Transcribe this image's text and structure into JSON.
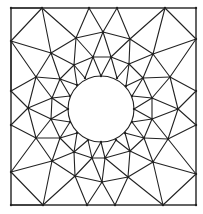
{
  "diagram": {
    "type": "triangular-finite-element-mesh",
    "colors": {
      "line": "#222222",
      "background": "#ffffff"
    },
    "border": {
      "x": 11,
      "y": 8,
      "width": 185,
      "height": 197
    },
    "hole": {
      "cx": 101,
      "cy": 109,
      "r": 33
    },
    "nodes": {
      "T1": [
        42,
        8
      ],
      "T2": [
        89,
        8
      ],
      "T3": [
        117,
        8
      ],
      "T4": [
        165,
        8
      ],
      "L1": [
        11,
        41
      ],
      "L2": [
        11,
        91
      ],
      "L3": [
        11,
        125
      ],
      "L4": [
        11,
        172
      ],
      "R1": [
        196,
        39
      ],
      "R2": [
        196,
        91
      ],
      "R3": [
        196,
        125
      ],
      "R4": [
        196,
        174
      ],
      "B1": [
        43,
        205
      ],
      "B2": [
        87,
        205
      ],
      "B3": [
        115,
        205
      ],
      "B4": [
        163,
        205
      ],
      "C1": [
        11,
        8
      ],
      "C2": [
        196,
        8
      ],
      "C3": [
        11,
        205
      ],
      "C4": [
        196,
        205
      ],
      "O1": [
        51,
        53
      ],
      "O2": [
        76,
        38
      ],
      "O3": [
        103,
        32
      ],
      "O4": [
        130,
        39
      ],
      "O5": [
        153,
        54
      ],
      "O6": [
        170,
        77
      ],
      "O7": [
        178,
        109
      ],
      "O8": [
        168,
        139
      ],
      "O9": [
        153,
        162
      ],
      "O10": [
        128,
        177
      ],
      "O11": [
        102,
        182
      ],
      "O12": [
        75,
        176
      ],
      "O13": [
        52,
        161
      ],
      "O14": [
        36,
        138
      ],
      "O15": [
        28,
        108
      ],
      "O16": [
        36,
        77
      ],
      "M1": [
        74,
        65
      ],
      "M2": [
        93,
        57
      ],
      "M3": [
        111,
        57
      ],
      "M4": [
        129,
        64
      ],
      "M5": [
        143,
        78
      ],
      "M6": [
        152,
        98
      ],
      "M7": [
        152,
        119
      ],
      "M8": [
        144,
        138
      ],
      "M9": [
        130,
        151
      ],
      "M10": [
        105,
        158
      ],
      "M11": [
        92,
        158
      ],
      "M12": [
        74,
        152
      ],
      "M13": [
        60,
        138
      ],
      "M14": [
        51,
        119
      ],
      "M15": [
        52,
        98
      ],
      "M16": [
        60,
        79
      ],
      "H1": [
        85,
        78
      ],
      "H2": [
        101,
        76
      ],
      "H3": [
        117,
        78
      ],
      "H4": [
        126,
        86
      ],
      "H5": [
        132,
        96
      ],
      "H6": [
        134,
        109
      ],
      "H7": [
        132,
        122
      ],
      "H8": [
        125,
        133
      ],
      "H9": [
        116,
        140
      ],
      "H10": [
        101,
        142
      ],
      "H11": [
        88,
        140
      ],
      "H12": [
        77,
        133
      ],
      "H13": [
        70,
        122
      ],
      "H14": [
        68,
        109
      ],
      "H15": [
        70,
        96
      ],
      "H16": [
        77,
        85
      ]
    },
    "edges": [
      [
        "C1",
        "T1"
      ],
      [
        "L1",
        "T1"
      ],
      [
        "T1",
        "O2"
      ],
      [
        "T1",
        "O1"
      ],
      [
        "L1",
        "O1"
      ],
      [
        "L1",
        "O16"
      ],
      [
        "L1",
        "L2"
      ],
      [
        "T2",
        "O2"
      ],
      [
        "T2",
        "O3"
      ],
      [
        "T3",
        "O3"
      ],
      [
        "T3",
        "O4"
      ],
      [
        "T4",
        "O4"
      ],
      [
        "T4",
        "O5"
      ],
      [
        "T4",
        "R1"
      ],
      [
        "R1",
        "O5"
      ],
      [
        "R1",
        "O6"
      ],
      [
        "O2",
        "O3"
      ],
      [
        "O3",
        "O4"
      ],
      [
        "O1",
        "O2"
      ],
      [
        "O4",
        "O5"
      ],
      [
        "O5",
        "O6"
      ],
      [
        "O6",
        "O7"
      ],
      [
        "O7",
        "O8"
      ],
      [
        "O8",
        "O9"
      ],
      [
        "O9",
        "O10"
      ],
      [
        "O10",
        "O11"
      ],
      [
        "O11",
        "O12"
      ],
      [
        "O12",
        "O13"
      ],
      [
        "O13",
        "O14"
      ],
      [
        "O14",
        "O15"
      ],
      [
        "O15",
        "O16"
      ],
      [
        "O16",
        "O1"
      ],
      [
        "L2",
        "O16"
      ],
      [
        "L2",
        "O15"
      ],
      [
        "L3",
        "O15"
      ],
      [
        "L3",
        "O14"
      ],
      [
        "L4",
        "O14"
      ],
      [
        "L4",
        "O13"
      ],
      [
        "C3",
        "B1"
      ],
      [
        "L4",
        "B1"
      ],
      [
        "B1",
        "O13"
      ],
      [
        "B1",
        "O12"
      ],
      [
        "B2",
        "O12"
      ],
      [
        "B2",
        "O11"
      ],
      [
        "B3",
        "O11"
      ],
      [
        "B3",
        "O10"
      ],
      [
        "B4",
        "O10"
      ],
      [
        "B4",
        "O9"
      ],
      [
        "B4",
        "R4"
      ],
      [
        "R4",
        "O9"
      ],
      [
        "R4",
        "O8"
      ],
      [
        "R3",
        "O8"
      ],
      [
        "R3",
        "O7"
      ],
      [
        "R2",
        "O7"
      ],
      [
        "R2",
        "O6"
      ],
      [
        "O1",
        "M1"
      ],
      [
        "O2",
        "M1"
      ],
      [
        "O2",
        "M2"
      ],
      [
        "O3",
        "M2"
      ],
      [
        "O3",
        "M3"
      ],
      [
        "O4",
        "M3"
      ],
      [
        "O4",
        "M4"
      ],
      [
        "O5",
        "M4"
      ],
      [
        "O5",
        "M5"
      ],
      [
        "O6",
        "M5"
      ],
      [
        "O6",
        "M6"
      ],
      [
        "O7",
        "M6"
      ],
      [
        "O7",
        "M7"
      ],
      [
        "O8",
        "M7"
      ],
      [
        "O8",
        "M8"
      ],
      [
        "O9",
        "M8"
      ],
      [
        "O9",
        "M9"
      ],
      [
        "O10",
        "M9"
      ],
      [
        "O10",
        "M10"
      ],
      [
        "O11",
        "M10"
      ],
      [
        "O11",
        "M11"
      ],
      [
        "O12",
        "M11"
      ],
      [
        "O12",
        "M12"
      ],
      [
        "O13",
        "M12"
      ],
      [
        "O13",
        "M13"
      ],
      [
        "O14",
        "M13"
      ],
      [
        "O14",
        "M14"
      ],
      [
        "O15",
        "M14"
      ],
      [
        "O15",
        "M15"
      ],
      [
        "O16",
        "M15"
      ],
      [
        "O16",
        "M16"
      ],
      [
        "O1",
        "M16"
      ],
      [
        "M1",
        "M2"
      ],
      [
        "M2",
        "M3"
      ],
      [
        "M3",
        "M4"
      ],
      [
        "M4",
        "M5"
      ],
      [
        "M5",
        "M6"
      ],
      [
        "M6",
        "M7"
      ],
      [
        "M7",
        "M8"
      ],
      [
        "M8",
        "M9"
      ],
      [
        "M9",
        "M10"
      ],
      [
        "M10",
        "M11"
      ],
      [
        "M11",
        "M12"
      ],
      [
        "M12",
        "M13"
      ],
      [
        "M13",
        "M14"
      ],
      [
        "M14",
        "M15"
      ],
      [
        "M15",
        "M16"
      ],
      [
        "M16",
        "M1"
      ],
      [
        "M1",
        "H16"
      ],
      [
        "M1",
        "H1"
      ],
      [
        "M2",
        "H1"
      ],
      [
        "M2",
        "H2"
      ],
      [
        "M3",
        "H2"
      ],
      [
        "M3",
        "H3"
      ],
      [
        "M4",
        "H3"
      ],
      [
        "M4",
        "H4"
      ],
      [
        "M5",
        "H4"
      ],
      [
        "M5",
        "H5"
      ],
      [
        "M6",
        "H5"
      ],
      [
        "M6",
        "H6"
      ],
      [
        "M7",
        "H6"
      ],
      [
        "M7",
        "H7"
      ],
      [
        "M8",
        "H7"
      ],
      [
        "M8",
        "H8"
      ],
      [
        "M9",
        "H8"
      ],
      [
        "M9",
        "H9"
      ],
      [
        "M10",
        "H9"
      ],
      [
        "M10",
        "H10"
      ],
      [
        "M11",
        "H10"
      ],
      [
        "M11",
        "H11"
      ],
      [
        "M12",
        "H11"
      ],
      [
        "M12",
        "H12"
      ],
      [
        "M13",
        "H12"
      ],
      [
        "M13",
        "H13"
      ],
      [
        "M14",
        "H13"
      ],
      [
        "M14",
        "H14"
      ],
      [
        "M15",
        "H14"
      ],
      [
        "M15",
        "H15"
      ],
      [
        "M16",
        "H15"
      ],
      [
        "M16",
        "H16"
      ]
    ]
  }
}
